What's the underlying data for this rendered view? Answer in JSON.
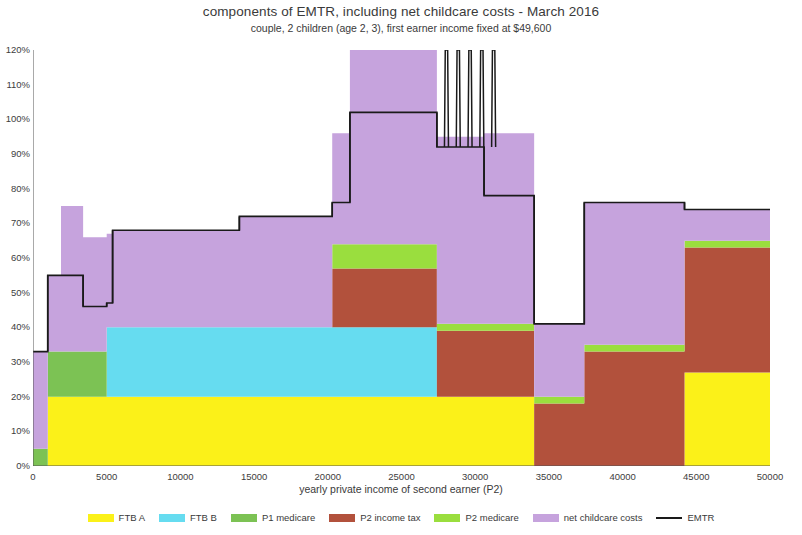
{
  "chart_data": {
    "type": "area",
    "title": "components of EMTR, including net childcare costs - March 2016",
    "subtitle": "couple, 2 children (age 2, 3), first earner income fixed at $49,600",
    "xlabel": "yearly private income of second earner (P2)",
    "ylabel": "",
    "xlim": [
      0,
      50000
    ],
    "ylim": [
      0,
      120
    ],
    "xticks": [
      0,
      5000,
      10000,
      15000,
      20000,
      25000,
      30000,
      35000,
      40000,
      45000,
      50000
    ],
    "xtick_labels": [
      "0",
      "5000",
      "10000",
      "15000",
      "20000",
      "25000",
      "30000",
      "35000",
      "40000",
      "45000",
      "50000"
    ],
    "yticks": [
      0,
      10,
      20,
      30,
      40,
      50,
      60,
      70,
      80,
      90,
      100,
      110,
      120
    ],
    "ytick_labels": [
      "0%",
      "10%",
      "20%",
      "30%",
      "40%",
      "50%",
      "60%",
      "70%",
      "80%",
      "90%",
      "100%",
      "110%",
      "120%"
    ],
    "grid": false,
    "stacked": true,
    "legend_position": "bottom",
    "legend": [
      "FTB A",
      "FTB B",
      "P1 medicare",
      "P2 income tax",
      "P2 medicare",
      "net childcare costs",
      "EMTR"
    ],
    "colors": {
      "ftb_a": "#fbf119",
      "ftb_b": "#66dcf0",
      "p1_medicare": "#7cc254",
      "p2_income_tax": "#b2513c",
      "p2_medicare": "#9ade3e",
      "net_childcare_costs": "#c6a3dd",
      "emtr_line": "#1a1a1a"
    },
    "series": [
      {
        "name": "FTB A",
        "color_key": "ftb_a",
        "steps": [
          {
            "x0": 0,
            "x1": 1000,
            "value": 0
          },
          {
            "x0": 1000,
            "x1": 34000,
            "value": 20
          },
          {
            "x0": 34000,
            "x1": 44200,
            "value": 0
          },
          {
            "x0": 44200,
            "x1": 50000,
            "value": 27
          }
        ]
      },
      {
        "name": "FTB B",
        "color_key": "ftb_b",
        "steps": [
          {
            "x0": 0,
            "x1": 5000,
            "value": 0
          },
          {
            "x0": 5000,
            "x1": 27400,
            "value": 20
          },
          {
            "x0": 27400,
            "x1": 50000,
            "value": 0
          }
        ]
      },
      {
        "name": "P1 medicare",
        "color_key": "p1_medicare",
        "steps": [
          {
            "x0": 0,
            "x1": 1000,
            "value": 5
          },
          {
            "x0": 1000,
            "x1": 1900,
            "value": 13
          },
          {
            "x0": 1900,
            "x1": 5000,
            "value": 13
          },
          {
            "x0": 5000,
            "x1": 50000,
            "value": 0
          }
        ]
      },
      {
        "name": "P2 income tax",
        "color_key": "p2_income_tax",
        "steps": [
          {
            "x0": 0,
            "x1": 20300,
            "value": 0
          },
          {
            "x0": 20300,
            "x1": 27400,
            "value": 17
          },
          {
            "x0": 27400,
            "x1": 34000,
            "value": 19
          },
          {
            "x0": 34000,
            "x1": 37400,
            "value": 18
          },
          {
            "x0": 37400,
            "x1": 44200,
            "value": 33
          },
          {
            "x0": 44200,
            "x1": 50000,
            "value": 36
          }
        ]
      },
      {
        "name": "P2 medicare",
        "color_key": "p2_medicare",
        "steps": [
          {
            "x0": 0,
            "x1": 20300,
            "value": 0
          },
          {
            "x0": 20300,
            "x1": 27400,
            "value": 7
          },
          {
            "x0": 27400,
            "x1": 34000,
            "value": 2
          },
          {
            "x0": 34000,
            "x1": 37400,
            "value": 2
          },
          {
            "x0": 37400,
            "x1": 44200,
            "value": 2
          },
          {
            "x0": 44200,
            "x1": 50000,
            "value": 2
          }
        ]
      },
      {
        "name": "net childcare costs",
        "color_key": "net_childcare_costs",
        "steps": [
          {
            "x0": 0,
            "x1": 1000,
            "value": 28
          },
          {
            "x0": 1000,
            "x1": 1900,
            "value": 22
          },
          {
            "x0": 1900,
            "x1": 2400,
            "value": 42
          },
          {
            "x0": 2400,
            "x1": 3400,
            "value": 42
          },
          {
            "x0": 3400,
            "x1": 5000,
            "value": 33
          },
          {
            "x0": 5000,
            "x1": 5400,
            "value": 27
          },
          {
            "x0": 5400,
            "x1": 14000,
            "value": 28
          },
          {
            "x0": 14000,
            "x1": 20300,
            "value": 32
          },
          {
            "x0": 20300,
            "x1": 21500,
            "value": 32
          },
          {
            "x0": 21500,
            "x1": 27400,
            "value": 58
          },
          {
            "x0": 27400,
            "x1": 30600,
            "value": 54
          },
          {
            "x0": 30600,
            "x1": 34000,
            "value": 55
          },
          {
            "x0": 34000,
            "x1": 37400,
            "value": 21
          },
          {
            "x0": 37400,
            "x1": 44200,
            "value": 41
          },
          {
            "x0": 44200,
            "x1": 50000,
            "value": 9
          }
        ]
      }
    ],
    "emtr_line": {
      "name": "EMTR",
      "color_key": "emtr_line",
      "description": "step line tracing top of stack, with five narrow spikes clipped above 120%",
      "steps": [
        {
          "x0": 0,
          "x1": 1000,
          "value": 33
        },
        {
          "x0": 1000,
          "x1": 1900,
          "value": 55
        },
        {
          "x0": 1900,
          "x1": 2400,
          "value": 55
        },
        {
          "x0": 2400,
          "x1": 3400,
          "value": 55
        },
        {
          "x0": 3400,
          "x1": 5000,
          "value": 46
        },
        {
          "x0": 5000,
          "x1": 5400,
          "value": 47
        },
        {
          "x0": 5400,
          "x1": 14000,
          "value": 68
        },
        {
          "x0": 14000,
          "x1": 20300,
          "value": 72
        },
        {
          "x0": 20300,
          "x1": 21500,
          "value": 76
        },
        {
          "x0": 21500,
          "x1": 27400,
          "value": 102
        },
        {
          "x0": 27400,
          "x1": 30600,
          "value": 92
        },
        {
          "x0": 30600,
          "x1": 34000,
          "value": 78
        },
        {
          "x0": 34000,
          "x1": 37400,
          "value": 41
        },
        {
          "x0": 37400,
          "x1": 44200,
          "value": 76
        },
        {
          "x0": 44200,
          "x1": 50000,
          "value": 74
        }
      ],
      "spikes": [
        {
          "x": 28050,
          "top": 128
        },
        {
          "x": 28850,
          "top": 128
        },
        {
          "x": 29650,
          "top": 128
        },
        {
          "x": 30450,
          "top": 128
        },
        {
          "x": 31250,
          "top": 128
        }
      ]
    }
  }
}
